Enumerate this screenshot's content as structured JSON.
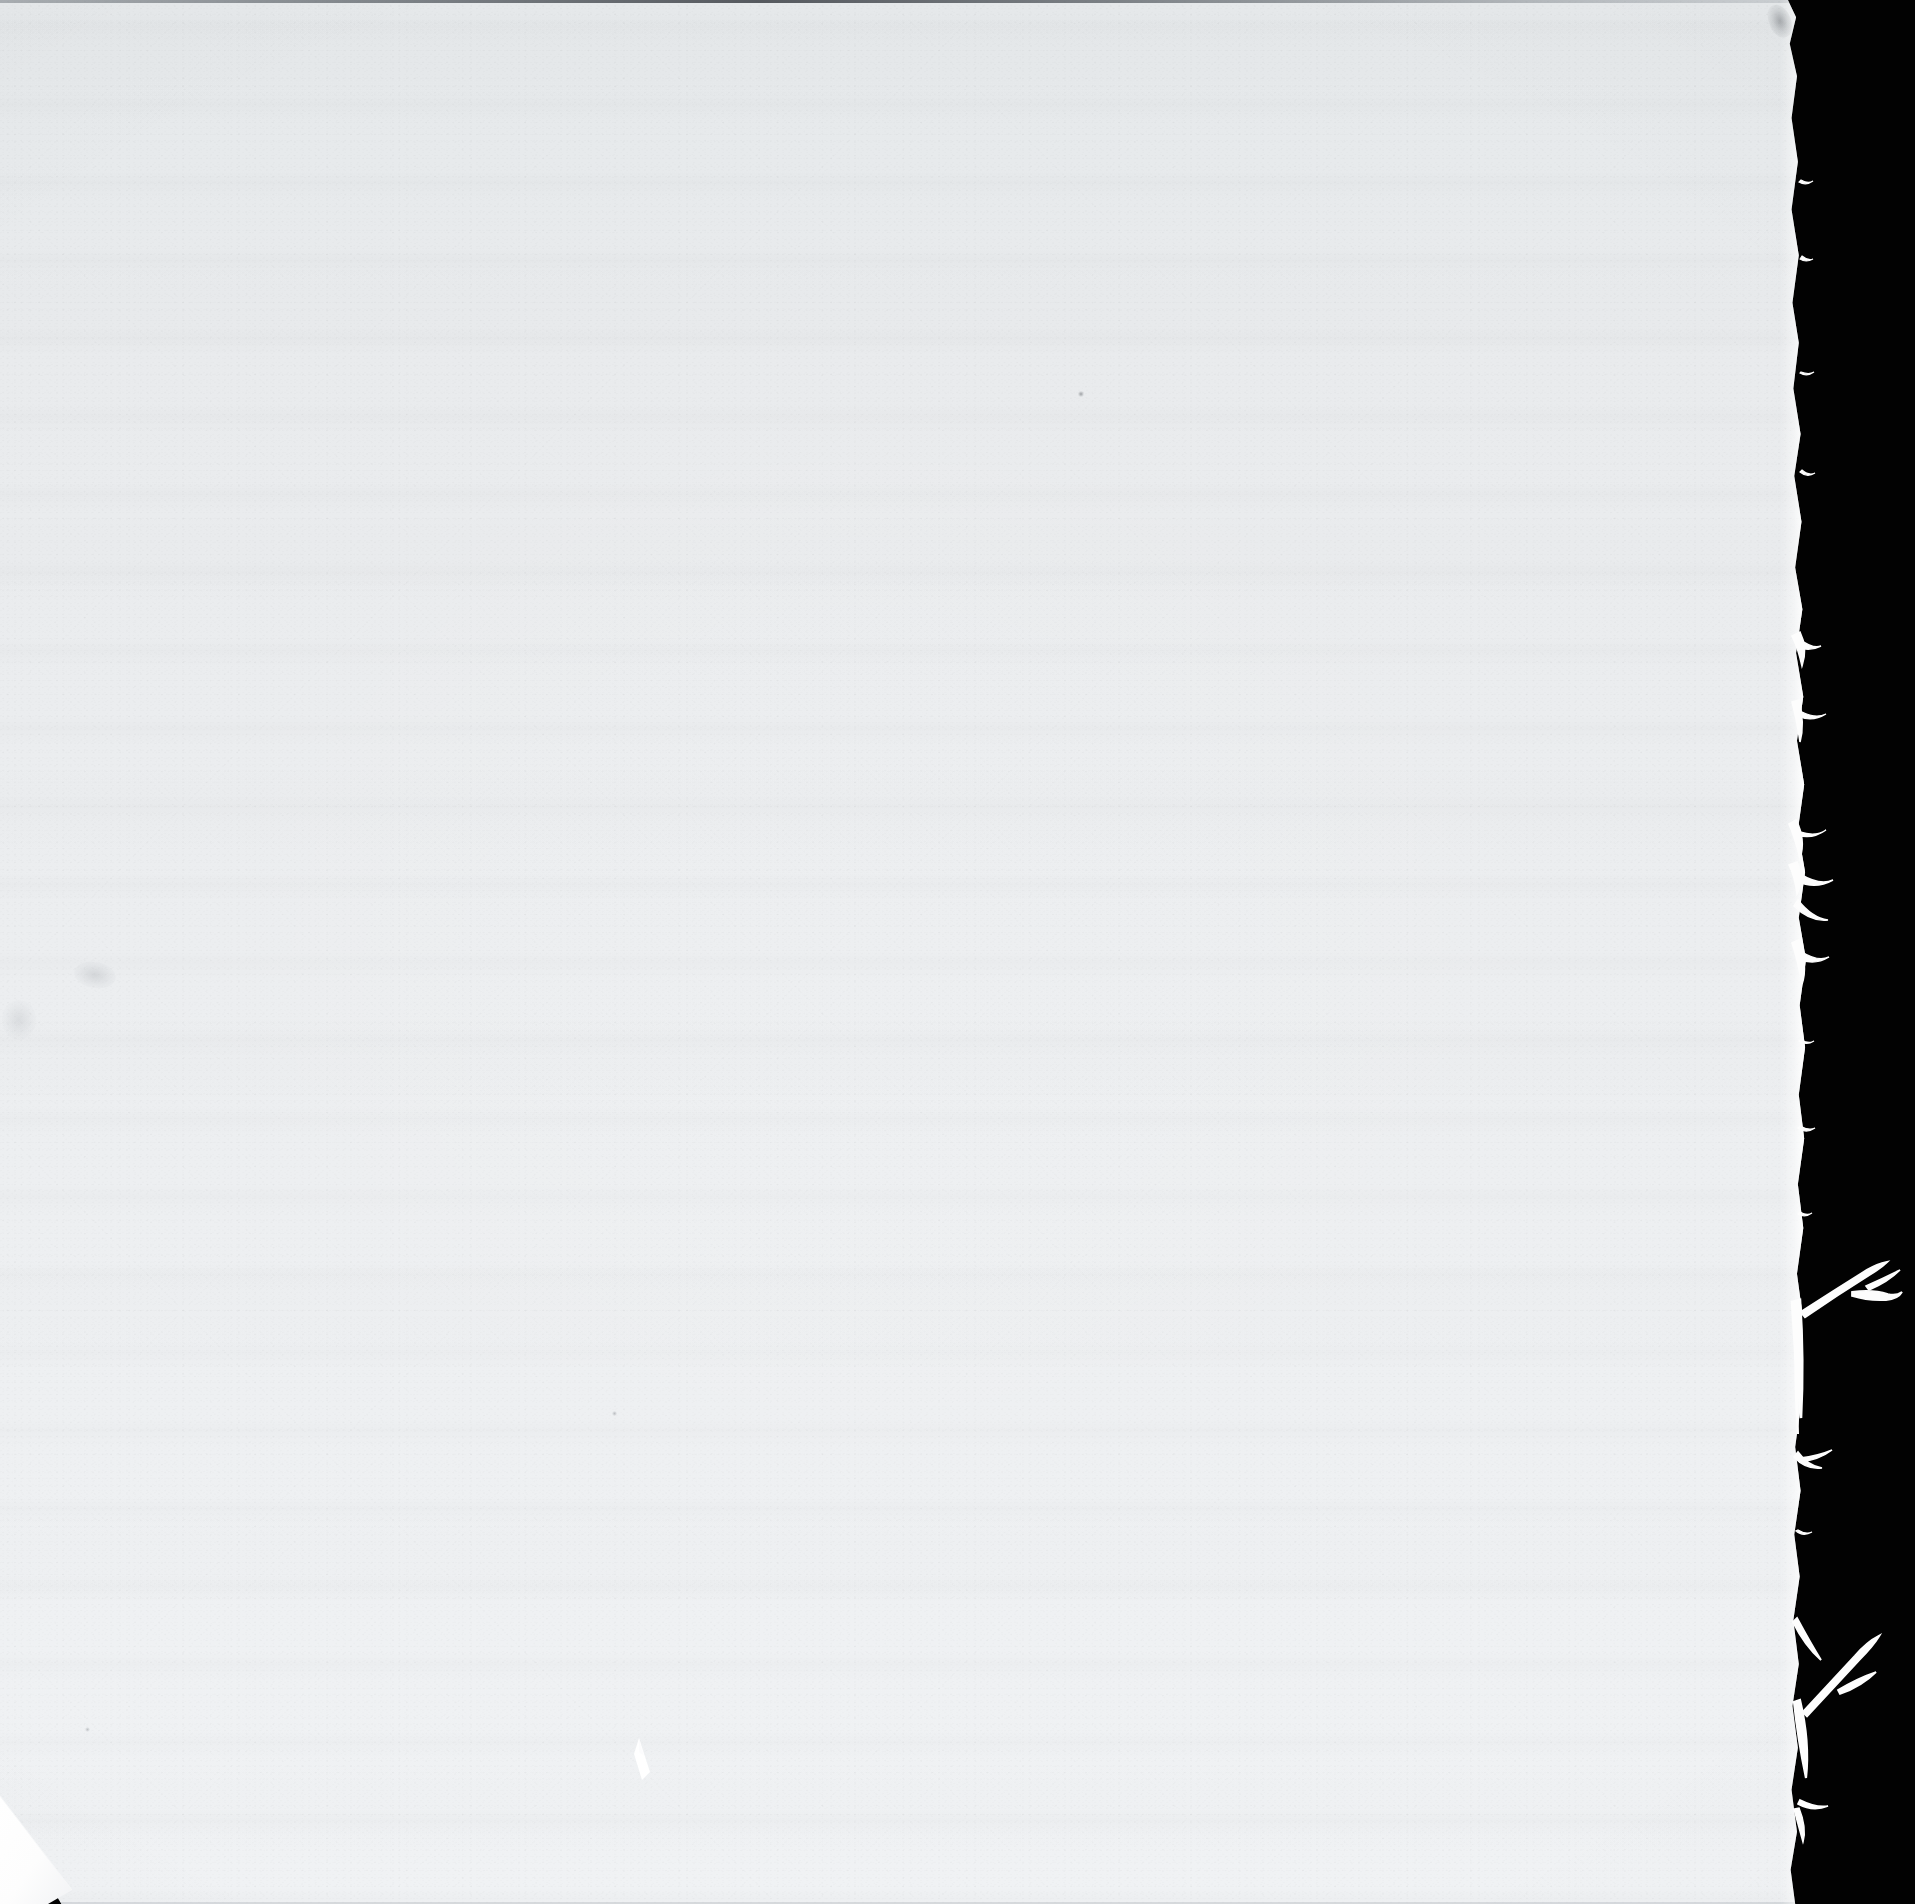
{
  "document": {
    "kind": "scanned-page",
    "content_text": "",
    "page_description": "Blank scanned page — no printed or handwritten text is visible"
  },
  "canvas": {
    "width_px": 1915,
    "height_px": 1904,
    "background_color": "#020202"
  },
  "page": {
    "name": "paper-sheet",
    "left_px": 0,
    "top_px": 0,
    "width_px": 1806,
    "height_px": 1904,
    "paper_color_top": "#e5e8ea",
    "paper_color_bottom": "#f0f2f4",
    "edge_highlight_color": "#ffffff"
  },
  "artifacts": {
    "torn_right_edge": {
      "name": "torn-right-edge",
      "description": "Irregular torn edge along the right side of the sheet with protruding paper fibres"
    },
    "corner_fold": {
      "name": "bottom-left-corner-fold",
      "description": "Dog-eared folded corner at the bottom-left of the sheet",
      "fold_color": "#ffffff"
    },
    "wedge": {
      "name": "paper-wedge-artifact",
      "description": "Small bright white wedge-shaped paper fragment near the lower centre",
      "left_px": 630,
      "top_px": 1738
    },
    "scan_banding": {
      "name": "horizontal-scan-banding",
      "description": "Faint horizontal tonal bands from the scanner sensor"
    },
    "smudges": [
      {
        "name": "smudge-top-right",
        "left_px": 1769,
        "top_px": 4
      },
      {
        "name": "smudge-left-margin",
        "left_px": 74,
        "top_px": 962
      },
      {
        "name": "smudge-far-left",
        "left_px": 2,
        "top_px": 1000
      },
      {
        "name": "speck-mid-upper",
        "left_px": 1078,
        "top_px": 391
      },
      {
        "name": "speck-lower-centre",
        "left_px": 612,
        "top_px": 1411
      },
      {
        "name": "speck-bottom-left",
        "left_px": 85,
        "top_px": 1727
      }
    ]
  }
}
